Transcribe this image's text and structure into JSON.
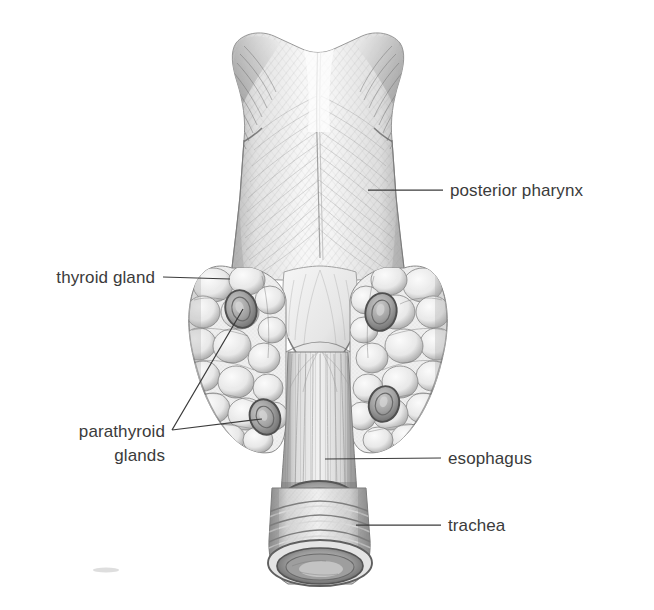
{
  "figure": {
    "kind": "anatomical-illustration",
    "style": "graphite pencil medical drawing",
    "background_color": "#ffffff",
    "ink_color": "#3b3b3b"
  },
  "labels": {
    "posterior_pharynx": "posterior pharynx",
    "thyroid_gland": "thyroid gland",
    "parathyroid_glands_line1": "parathyroid",
    "parathyroid_glands_line2": "glands",
    "esophagus": "esophagus",
    "trachea": "trachea"
  },
  "structures": {
    "pharynx": "posterior pharynx",
    "thyroid_left_lobe": "thyroid gland left lobe",
    "thyroid_right_lobe": "thyroid gland right lobe",
    "parathyroid_upper_left": "superior left parathyroid gland",
    "parathyroid_lower_left": "inferior left parathyroid gland",
    "parathyroid_upper_right": "superior right parathyroid gland",
    "parathyroid_lower_right": "inferior right parathyroid gland",
    "esophagus": "esophagus",
    "trachea": "trachea",
    "tracheal_lumen": "tracheal lumen",
    "esophageal_lumen": "esophageal lumen"
  }
}
